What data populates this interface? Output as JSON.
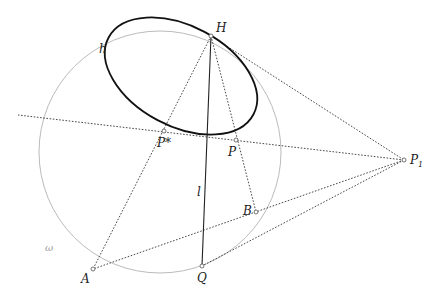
{
  "diagram": {
    "colors": {
      "circle": "#bbbbbb",
      "ellipse": "#111111",
      "solid_line": "#222222",
      "dotted_line": "#333333",
      "point_fill": "#ffffff",
      "point_stroke": "#555555"
    },
    "circle": {
      "name": "ω",
      "label": "ω",
      "cx": 160,
      "cy": 152,
      "r": 121
    },
    "ellipse": {
      "name": "h",
      "label": "h",
      "cx": 181,
      "cy": 76,
      "rx": 82,
      "ry": 50,
      "rotation": 28
    },
    "points": [
      {
        "id": "H",
        "label": "H",
        "x": 211,
        "y": 36
      },
      {
        "id": "P*",
        "label": "P*",
        "x": 164,
        "y": 131
      },
      {
        "id": "P",
        "label": "P",
        "x": 236,
        "y": 140
      },
      {
        "id": "P1",
        "label": "P",
        "subscript": "1",
        "x": 404,
        "y": 160
      },
      {
        "id": "B",
        "label": "B",
        "x": 256,
        "y": 212
      },
      {
        "id": "A",
        "label": "A",
        "x": 93,
        "y": 269
      },
      {
        "id": "Q",
        "label": "Q",
        "x": 202,
        "y": 266
      }
    ],
    "line_labels": [
      {
        "id": "l",
        "label": "l"
      }
    ],
    "segments_solid": [
      {
        "from": "H",
        "to": "Q",
        "name": "l"
      }
    ],
    "segments_dotted": [
      {
        "from": "H",
        "to": "P1"
      },
      {
        "from": "H",
        "to": "A"
      },
      {
        "from": "H",
        "to": "B"
      },
      {
        "from": "P1",
        "to": "A"
      },
      {
        "from": "P1",
        "to": "Q"
      },
      {
        "from": "P1",
        "to": "extend-left",
        "note": "line through P and P* to circle"
      }
    ]
  }
}
